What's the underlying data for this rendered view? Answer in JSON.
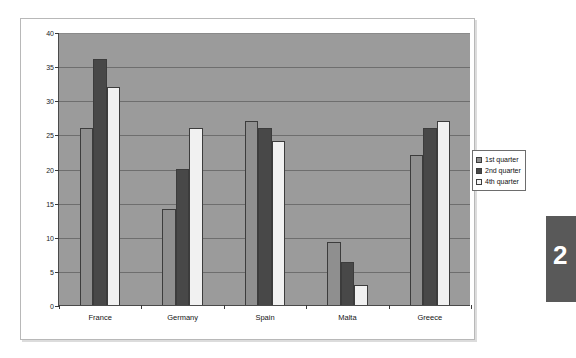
{
  "page_tab": {
    "number": "2"
  },
  "legend": {
    "position": "right-outside",
    "items": [
      {
        "label": "1st quarter",
        "color": "#8f8f8f",
        "swatch": "series-1-swatch"
      },
      {
        "label": "2nd quarter",
        "color": "#484848",
        "swatch": "series-2-swatch"
      },
      {
        "label": "4th quarter",
        "color": "#f1f1f1",
        "swatch": "series-3-swatch"
      }
    ]
  },
  "axis": {
    "y_ticks": [
      "0",
      "5",
      "10",
      "15",
      "20",
      "25",
      "30",
      "35",
      "40"
    ],
    "x_categories": [
      "France",
      "Germany",
      "Spain",
      "Malta",
      "Greece"
    ]
  },
  "chart_data": {
    "type": "bar",
    "title": "",
    "subtitle": "",
    "xlabel": "",
    "ylabel": "",
    "ylim": [
      0,
      40
    ],
    "ytick_step": 5,
    "grid": true,
    "legend_position": "right",
    "plot_background": "#9b9b9b",
    "categories": [
      "France",
      "Germany",
      "Spain",
      "Malta",
      "Greece"
    ],
    "series": [
      {
        "name": "1st quarter",
        "color": "#8f8f8f",
        "values": [
          26,
          14,
          27,
          9.2,
          22
        ]
      },
      {
        "name": "2nd quarter",
        "color": "#484848",
        "values": [
          36,
          20,
          26,
          6.3,
          26
        ]
      },
      {
        "name": "4th quarter",
        "color": "#f1f1f1",
        "values": [
          32,
          26,
          24,
          3,
          27
        ]
      }
    ]
  }
}
